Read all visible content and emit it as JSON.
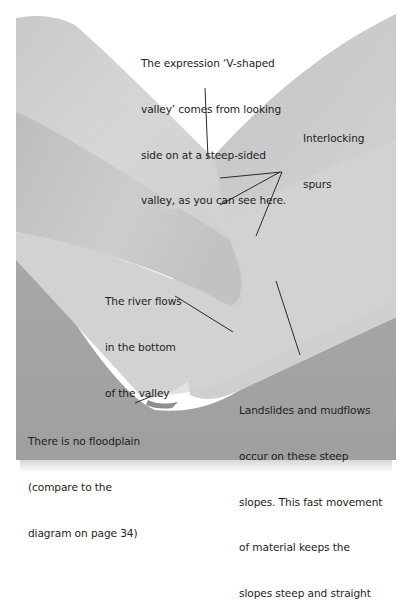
{
  "diagram": {
    "colors": {
      "background": "#ffffff",
      "spur_light": "#d8d8d8",
      "spur_mid": "#c4c4c4",
      "spur_dark": "#b2b2b2",
      "valley_floor": "#a5a5a5",
      "river": "#8f8f8f",
      "leader_line": "#2a2a2a",
      "text": "#1e1e1e"
    },
    "annotations": {
      "v_shape": {
        "lines": [
          "The expression ‘V-shaped",
          "valley’ comes from looking",
          "side on at a steep-sided",
          "valley, as you can see here."
        ]
      },
      "spurs": {
        "lines": [
          "Interlocking",
          "spurs"
        ]
      },
      "river": {
        "lines": [
          "The river flows",
          "in the bottom",
          "of the valley"
        ]
      },
      "floodplain": {
        "lines": [
          "There is no floodplain",
          "(compare to the",
          "diagram on page 34)"
        ]
      },
      "slopes": {
        "lines": [
          "Landslides and mudflows",
          "occur on these steep",
          "slopes. This fast movement",
          "of material keeps the",
          "slopes steep and straight"
        ]
      }
    }
  }
}
